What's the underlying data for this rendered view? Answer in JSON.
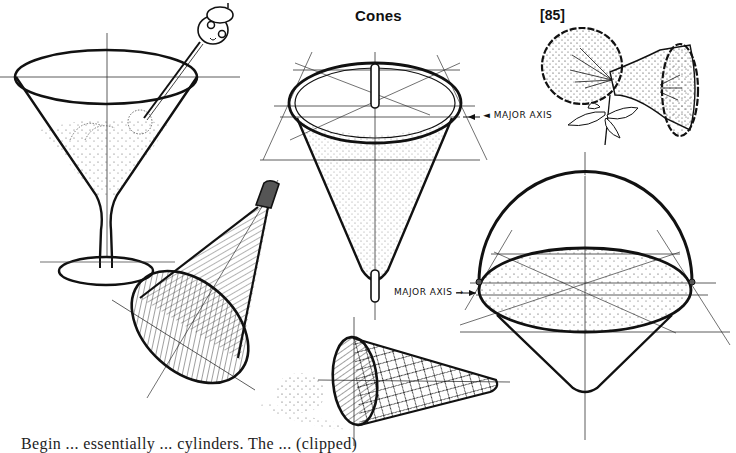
{
  "page": {
    "title": "Cones",
    "page_number": "[85]",
    "labels": {
      "major_axis_top": "◄ MAJOR AXIS",
      "major_axis_bottom": "MAJOR AXIS →"
    },
    "bottom_text_partial": "Begin ... essentially ... cylinders. The ... (clipped)"
  },
  "illustrations": [
    {
      "id": "martini-glass",
      "description": "Martini glass with cocktail pick and olive, construction axes"
    },
    {
      "id": "upright-cone",
      "description": "Inverted cone with rod through center, stippled shading, construction lines"
    },
    {
      "id": "flowers",
      "description": "Two trumpet-shaped flowers (morning glory) with stem and leaves"
    },
    {
      "id": "megaphone-cone",
      "description": "Tilted cone with hatched interior and handle tip"
    },
    {
      "id": "ice-cream-cone",
      "description": "Waffle cone lying on side with spilled scoop"
    },
    {
      "id": "basket-cone",
      "description": "Cone with semicircular handle and stippled ellipse top"
    }
  ],
  "colors": {
    "ink": "#111111",
    "paper": "#ffffff",
    "construction": "#333333"
  }
}
